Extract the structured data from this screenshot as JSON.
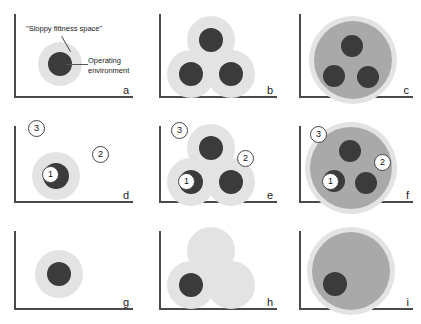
{
  "figure": {
    "type": "diagram",
    "colors": {
      "halo": "#e3e3e3",
      "mid_fill": "#a9a9a9",
      "dot": "#3b3b3b",
      "axis": "#4a4a4a",
      "marker_fill": "#ffffff",
      "marker_border": "#444444",
      "background": "#ffffff"
    },
    "annotations": {
      "fitness_space_label": "\"Sloppy fittness space\"",
      "operating_environment_label": "Operating\nenvironment"
    },
    "panels": [
      {
        "id": "a",
        "letter": "a",
        "kind": "single-blob",
        "markers": [],
        "annotated": true
      },
      {
        "id": "b",
        "letter": "b",
        "kind": "triple-blob",
        "markers": [],
        "annotated": false
      },
      {
        "id": "c",
        "letter": "c",
        "kind": "merged-blob-three-dots",
        "markers": [],
        "annotated": false
      },
      {
        "id": "d",
        "letter": "d",
        "kind": "single-blob-markers",
        "markers": [
          "1",
          "2",
          "3"
        ],
        "annotated": false
      },
      {
        "id": "e",
        "letter": "e",
        "kind": "triple-blob-markers",
        "markers": [
          "1",
          "2",
          "3"
        ],
        "annotated": false
      },
      {
        "id": "f",
        "letter": "f",
        "kind": "merged-blob-markers",
        "markers": [
          "1",
          "2",
          "3"
        ],
        "annotated": false
      },
      {
        "id": "g",
        "letter": "g",
        "kind": "single-blob",
        "markers": [],
        "annotated": false
      },
      {
        "id": "h",
        "letter": "h",
        "kind": "triple-blob-one-dot",
        "markers": [],
        "annotated": false
      },
      {
        "id": "i",
        "letter": "i",
        "kind": "merged-blob-one-dot",
        "markers": [],
        "annotated": false
      }
    ],
    "markers": {
      "one": "1",
      "two": "2",
      "three": "3"
    }
  }
}
